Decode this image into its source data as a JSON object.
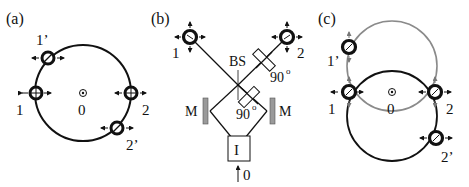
{
  "panels": {
    "a": {
      "label": "(a)",
      "nodes": {
        "n1": "1",
        "n2": "2",
        "n1p": "1’",
        "n2p": "2’",
        "center": "0"
      }
    },
    "b": {
      "label": "(b)",
      "nodes": {
        "n1": "1",
        "n2": "2",
        "source": "0"
      },
      "components": {
        "beam_splitter": "BS",
        "waveplate_top": "90",
        "waveplate_mid": "90",
        "degree": "o",
        "mirror_left": "M",
        "mirror_right": "M",
        "box": "I"
      }
    },
    "c": {
      "label": "(c)",
      "nodes": {
        "n1": "1",
        "n2": "2",
        "n1p": "1’",
        "n2p": "2’",
        "center": "0"
      }
    }
  },
  "colors": {
    "ink": "#111111",
    "gray_circle": "#8a8a8a",
    "mirror": "#9a9a9a"
  }
}
